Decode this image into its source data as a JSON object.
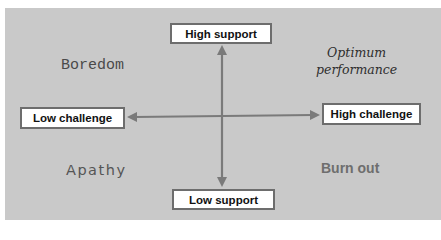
{
  "diagram": {
    "type": "quadrant",
    "axes": {
      "vertical": {
        "top_label": "High support",
        "bottom_label": "Low support"
      },
      "horizontal": {
        "left_label": "Low challenge",
        "right_label": "High challenge"
      }
    },
    "quadrants": {
      "top_left": "Boredom",
      "top_right_line1": "Optimum",
      "top_right_line2": "performance",
      "bottom_left": "Apathy",
      "bottom_right": "Burn out"
    },
    "colors": {
      "panel_background": "#c9c9c9",
      "box_fill": "#ffffff",
      "box_border": "#6d6d6d",
      "axis_line": "#7a7a7a"
    }
  }
}
